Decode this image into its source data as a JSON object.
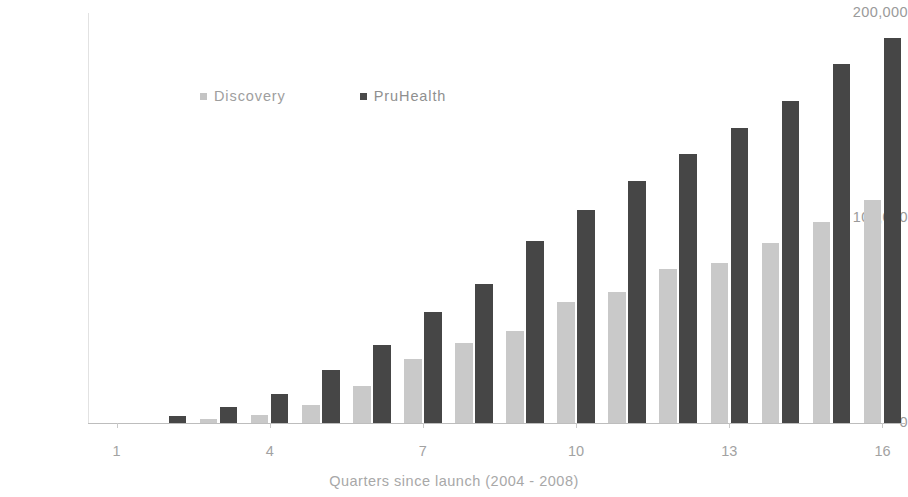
{
  "chart_data": {
    "type": "bar",
    "title": "",
    "xlabel": "Quarters since launch (2004 - 2008)",
    "ylabel": "",
    "categories": [
      "1",
      "2",
      "3",
      "4",
      "5",
      "6",
      "7",
      "8",
      "9",
      "10",
      "11",
      "12",
      "13",
      "14",
      "15",
      "16"
    ],
    "x_tick_labels": [
      "1",
      "4",
      "7",
      "10",
      "13",
      "16"
    ],
    "y_tick_labels": [
      "0",
      "100,000",
      "200,000"
    ],
    "ylim": [
      0,
      200000
    ],
    "xlim_note": "16 quarter groups, grouped (clustered) bars",
    "grid": false,
    "legend_position": "inside top-left",
    "series": [
      {
        "name": "Discovery",
        "color": "#c9c9c9",
        "values": [
          0,
          0,
          2000,
          4000,
          9000,
          18000,
          31000,
          39000,
          45000,
          59000,
          64000,
          75000,
          78000,
          88000,
          98000,
          109000
        ]
      },
      {
        "name": "PruHealth",
        "color": "#464646",
        "values": [
          0,
          3500,
          8000,
          14000,
          26000,
          38000,
          54000,
          68000,
          89000,
          104000,
          118000,
          131000,
          144000,
          157000,
          175000,
          188000
        ]
      }
    ]
  },
  "axes": {
    "x_title": "Quarters since launch (2004 - 2008)",
    "y_ticks": [
      {
        "label": "0",
        "value": 0
      },
      {
        "label": "100,000",
        "value": 100000
      },
      {
        "label": "200,000",
        "value": 200000
      }
    ],
    "x_ticks": [
      {
        "label": "1",
        "quarter": 1
      },
      {
        "label": "4",
        "quarter": 4
      },
      {
        "label": "7",
        "quarter": 7
      },
      {
        "label": "10",
        "quarter": 10
      },
      {
        "label": "13",
        "quarter": 13
      },
      {
        "label": "16",
        "quarter": 16
      }
    ]
  },
  "legend": {
    "items": [
      {
        "label": "Discovery",
        "color": "#c4c4c4"
      },
      {
        "label": "PruHealth",
        "color": "#4a4a4a"
      }
    ]
  },
  "colors": {
    "discovery": "#c9c9c9",
    "pruhealth": "#464646",
    "axis_text": "#9e9e9e",
    "axis_line": "#bdbdbd",
    "background": "#ffffff"
  }
}
